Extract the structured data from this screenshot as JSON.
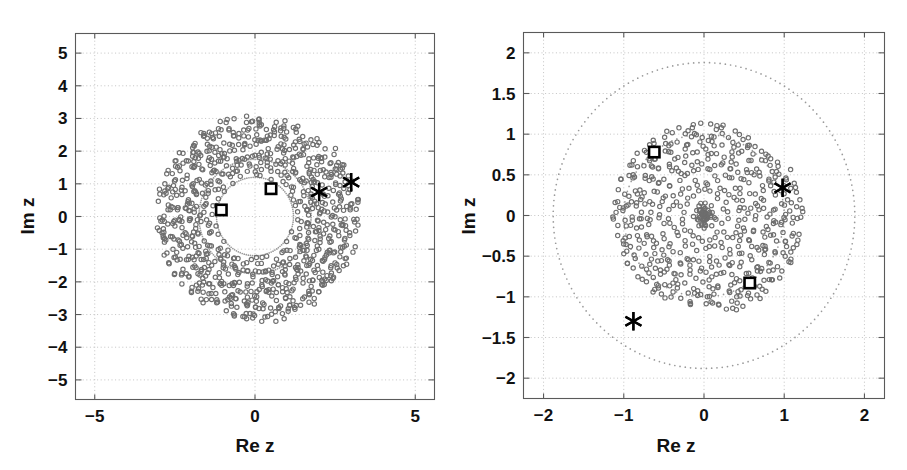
{
  "figure": {
    "title": "",
    "panels": [
      "left",
      "right"
    ]
  },
  "chart_data": [
    {
      "id": "left-panel",
      "type": "scatter",
      "title": "",
      "xlabel": "Re z",
      "ylabel": "Im z",
      "xlim": [
        -5.6,
        5.6
      ],
      "ylim": [
        -5.6,
        5.6
      ],
      "xticks": [
        -5,
        0,
        5
      ],
      "xticklabels": [
        "-5",
        "0",
        "5"
      ],
      "yticks": [
        -5,
        -4,
        -3,
        -2,
        -1,
        0,
        1,
        2,
        3,
        4,
        5
      ],
      "yticklabels": [
        "5",
        "4",
        "3",
        "2",
        "1",
        "0",
        "-1",
        "-2",
        "-3",
        "-4",
        "-5"
      ],
      "grid": true,
      "legend": "none",
      "series": [
        {
          "name": "eigenvalue-cloud",
          "marker": "open-circle",
          "color": "#6e6e6e",
          "description": "dense annular scatter cloud filling the disk between radius ~1.25 and ~4.65, empty core inside radius ~1.2",
          "n_points": 900,
          "inner_radius": 1.25,
          "outer_radius": 4.65
        },
        {
          "name": "inner-dotted-circle",
          "marker": "dot",
          "color": "#9a9a9a",
          "description": "faint dotted reference circle",
          "radius": 1.2
        },
        {
          "name": "mid-dotted-circle",
          "marker": "dot",
          "color": "#9a9a9a",
          "description": "faint dotted reference circle",
          "radius": 1.75
        },
        {
          "name": "square-markers",
          "marker": "square",
          "color": "#000000",
          "points": [
            {
              "x": -1.05,
              "y": 0.2
            },
            {
              "x": 0.5,
              "y": 0.85
            }
          ]
        },
        {
          "name": "asterisk-markers",
          "marker": "asterisk",
          "color": "#000000",
          "points": [
            {
              "x": 2.0,
              "y": 0.75
            },
            {
              "x": 3.0,
              "y": 1.05
            }
          ]
        }
      ]
    },
    {
      "id": "right-panel",
      "type": "scatter",
      "title": "",
      "xlabel": "Re z",
      "ylabel": "Im z",
      "xlim": [
        -2.25,
        2.25
      ],
      "ylim": [
        -2.25,
        2.25
      ],
      "xticks": [
        -2,
        -1,
        0,
        1,
        2
      ],
      "xticklabels": [
        "-2",
        "-1",
        "0",
        "1",
        "2"
      ],
      "yticks": [
        -2,
        -1.5,
        -1,
        -0.5,
        0,
        0.5,
        1,
        1.5,
        2
      ],
      "yticklabels": [
        "2",
        "1.5",
        "1",
        "0.5",
        "0",
        "-0.5",
        "-1",
        "-1.5",
        "-2"
      ],
      "grid": true,
      "legend": "none",
      "series": [
        {
          "name": "eigenvalue-cloud",
          "marker": "open-circle",
          "color": "#6e6e6e",
          "description": "scatter filling the whole disk of radius ~1.88 with a dense cluster near the origin",
          "n_points": 560,
          "inner_radius": 0.0,
          "outer_radius": 1.88
        },
        {
          "name": "outer-dotted-circle",
          "marker": "dot",
          "color": "#9a9a9a",
          "description": "faint dotted boundary circle",
          "radius": 1.88
        },
        {
          "name": "mid-dotted-circle",
          "marker": "dot",
          "color": "#9a9a9a",
          "description": "faint dotted reference circle",
          "radius": 1.0
        },
        {
          "name": "square-markers",
          "marker": "square",
          "color": "#000000",
          "points": [
            {
              "x": -0.62,
              "y": 0.78
            },
            {
              "x": 0.57,
              "y": -0.83
            }
          ]
        },
        {
          "name": "asterisk-markers",
          "marker": "asterisk",
          "color": "#000000",
          "points": [
            {
              "x": 0.98,
              "y": 0.34
            },
            {
              "x": -0.88,
              "y": -1.3
            }
          ]
        }
      ]
    }
  ]
}
